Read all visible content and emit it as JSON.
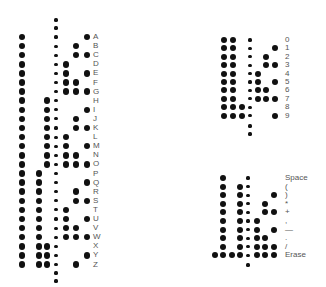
{
  "colors": {
    "hole": "#111111",
    "label": "#555555",
    "background": "#ffffff"
  },
  "chart_data": [
    {
      "type": "table",
      "title": "Letters",
      "channel_x": [
        22,
        31,
        39,
        47,
        66,
        76,
        87
      ],
      "sprocket_x": 56,
      "label_x": 93,
      "row_y_start": 37,
      "row_pitch": 9.1,
      "leader_sprockets_y": [
        20,
        28
      ],
      "trailer_sprockets_y": [
        273,
        281
      ],
      "rows": [
        {
          "label": "A",
          "holes": [
            1,
            0,
            0,
            0,
            0,
            0,
            1
          ]
        },
        {
          "label": "B",
          "holes": [
            1,
            0,
            0,
            0,
            0,
            1,
            0
          ]
        },
        {
          "label": "C",
          "holes": [
            1,
            0,
            0,
            0,
            0,
            1,
            1
          ]
        },
        {
          "label": "D",
          "holes": [
            1,
            0,
            0,
            0,
            1,
            0,
            0
          ]
        },
        {
          "label": "E",
          "holes": [
            1,
            0,
            0,
            0,
            1,
            0,
            1
          ]
        },
        {
          "label": "F",
          "holes": [
            1,
            0,
            0,
            0,
            1,
            1,
            0
          ]
        },
        {
          "label": "G",
          "holes": [
            1,
            0,
            0,
            0,
            1,
            1,
            1
          ]
        },
        {
          "label": "H",
          "holes": [
            1,
            0,
            0,
            1,
            0,
            0,
            0
          ]
        },
        {
          "label": "I",
          "holes": [
            1,
            0,
            0,
            1,
            0,
            0,
            1
          ]
        },
        {
          "label": "J",
          "holes": [
            1,
            0,
            0,
            1,
            0,
            1,
            0
          ]
        },
        {
          "label": "K",
          "holes": [
            1,
            0,
            0,
            1,
            0,
            1,
            1
          ]
        },
        {
          "label": "L",
          "holes": [
            1,
            0,
            0,
            1,
            1,
            0,
            0
          ]
        },
        {
          "label": "M",
          "holes": [
            1,
            0,
            0,
            1,
            1,
            0,
            1
          ]
        },
        {
          "label": "N",
          "holes": [
            1,
            0,
            0,
            1,
            1,
            1,
            0
          ]
        },
        {
          "label": "O",
          "holes": [
            1,
            0,
            0,
            1,
            1,
            1,
            1
          ]
        },
        {
          "label": "P",
          "holes": [
            1,
            0,
            1,
            0,
            0,
            0,
            0
          ]
        },
        {
          "label": "Q",
          "holes": [
            1,
            0,
            1,
            0,
            0,
            0,
            1
          ]
        },
        {
          "label": "R",
          "holes": [
            1,
            0,
            1,
            0,
            0,
            1,
            0
          ]
        },
        {
          "label": "S",
          "holes": [
            1,
            0,
            1,
            0,
            0,
            1,
            1
          ]
        },
        {
          "label": "T",
          "holes": [
            1,
            0,
            1,
            0,
            1,
            0,
            0
          ]
        },
        {
          "label": "U",
          "holes": [
            1,
            0,
            1,
            0,
            1,
            0,
            1
          ]
        },
        {
          "label": "V",
          "holes": [
            1,
            0,
            1,
            0,
            1,
            1,
            0
          ]
        },
        {
          "label": "W",
          "holes": [
            1,
            0,
            1,
            0,
            1,
            1,
            1
          ]
        },
        {
          "label": "X",
          "holes": [
            1,
            0,
            1,
            1,
            0,
            0,
            0
          ]
        },
        {
          "label": "Y",
          "holes": [
            1,
            0,
            1,
            1,
            0,
            0,
            1
          ]
        },
        {
          "label": "Z",
          "holes": [
            1,
            0,
            1,
            1,
            0,
            1,
            0
          ]
        }
      ]
    },
    {
      "type": "table",
      "title": "Digits",
      "channel_x": [
        224,
        233,
        242,
        258,
        266,
        275
      ],
      "sprocket_x": 250,
      "label_x": 285,
      "row_y_start": 40,
      "row_pitch": 8.4,
      "leader_sprockets_y": [],
      "trailer_sprockets_y": [
        126,
        134
      ],
      "rows": [
        {
          "label": "0",
          "holes": [
            1,
            1,
            0,
            0,
            0,
            0
          ]
        },
        {
          "label": "1",
          "holes": [
            1,
            1,
            0,
            0,
            0,
            1
          ]
        },
        {
          "label": "2",
          "holes": [
            1,
            1,
            0,
            0,
            1,
            0
          ]
        },
        {
          "label": "3",
          "holes": [
            1,
            1,
            0,
            0,
            1,
            1
          ]
        },
        {
          "label": "4",
          "holes": [
            1,
            1,
            0,
            1,
            0,
            0
          ]
        },
        {
          "label": "5",
          "holes": [
            1,
            1,
            0,
            1,
            0,
            1
          ]
        },
        {
          "label": "6",
          "holes": [
            1,
            1,
            0,
            1,
            1,
            0
          ]
        },
        {
          "label": "7",
          "holes": [
            1,
            1,
            0,
            1,
            1,
            1
          ]
        },
        {
          "label": "8",
          "holes": [
            1,
            1,
            1,
            0,
            0,
            0
          ]
        },
        {
          "label": "9",
          "holes": [
            1,
            1,
            1,
            0,
            0,
            1
          ]
        }
      ]
    },
    {
      "type": "table",
      "title": "Punctuation",
      "channel_x": [
        215,
        223,
        232,
        240,
        257,
        265,
        274
      ],
      "sprocket_x": 248,
      "label_x": 285,
      "row_y_start": 178,
      "row_pitch": 8.6,
      "leader_sprockets_y": [],
      "trailer_sprockets_y": [
        265
      ],
      "rows": [
        {
          "label": "Space",
          "holes": [
            0,
            1,
            0,
            0,
            0,
            0,
            0
          ]
        },
        {
          "label": "(",
          "holes": [
            0,
            1,
            0,
            1,
            0,
            0,
            0
          ]
        },
        {
          "label": ")",
          "holes": [
            0,
            1,
            0,
            1,
            0,
            0,
            1
          ]
        },
        {
          "label": "*",
          "holes": [
            0,
            1,
            0,
            1,
            0,
            1,
            0
          ]
        },
        {
          "label": "+",
          "holes": [
            0,
            1,
            0,
            1,
            0,
            1,
            1
          ]
        },
        {
          "label": ",",
          "holes": [
            0,
            1,
            0,
            1,
            1,
            0,
            0
          ]
        },
        {
          "label": "—",
          "holes": [
            0,
            1,
            0,
            1,
            1,
            0,
            1
          ]
        },
        {
          "label": ".",
          "holes": [
            0,
            1,
            0,
            1,
            1,
            1,
            0
          ]
        },
        {
          "label": "/",
          "holes": [
            0,
            1,
            0,
            1,
            1,
            1,
            1
          ]
        },
        {
          "label": "Erase",
          "holes": [
            1,
            1,
            1,
            1,
            1,
            1,
            1
          ]
        }
      ]
    }
  ]
}
